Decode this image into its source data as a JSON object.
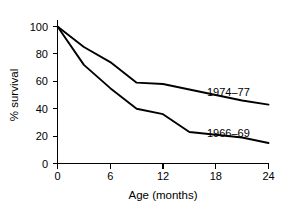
{
  "chart_data": {
    "type": "line",
    "title": "",
    "xlabel": "Age (months)",
    "ylabel": "% survival",
    "xlim": [
      0,
      24
    ],
    "ylim": [
      0,
      100
    ],
    "grid": false,
    "legend_position": "inline-right-of-curve",
    "x_ticks": [
      0,
      6,
      12,
      18,
      24
    ],
    "x_tick_labels": [
      "0",
      "6",
      "12",
      "18",
      "24"
    ],
    "y_ticks": [
      0,
      20,
      40,
      60,
      80,
      100
    ],
    "y_tick_labels": [
      "0",
      "20",
      "40",
      "60",
      "80",
      "100"
    ],
    "series": [
      {
        "name": "1974–77",
        "label": "1974–77",
        "color": "#000000",
        "x": [
          0,
          3,
          6,
          9,
          12,
          15,
          18,
          21,
          24
        ],
        "values": [
          100,
          85,
          74,
          59,
          58,
          54,
          50,
          46,
          43
        ]
      },
      {
        "name": "1966–69",
        "label": "1966–69",
        "color": "#000000",
        "x": [
          0,
          3,
          6,
          9,
          12,
          15,
          18,
          21,
          24
        ],
        "values": [
          100,
          72,
          55,
          40,
          36,
          23,
          21,
          19,
          15
        ]
      }
    ]
  },
  "axis": {
    "x_title": "Age (months)",
    "y_title": "% survival"
  },
  "labels": {
    "series_1974_77": "1974–77",
    "series_1966_69": "1966–69"
  },
  "y_tick_labels": {
    "t0": "0",
    "t20": "20",
    "t40": "40",
    "t60": "60",
    "t80": "80",
    "t100": "100"
  },
  "x_tick_labels": {
    "t0": "0",
    "t6": "6",
    "t12": "12",
    "t18": "18",
    "t24": "24"
  }
}
